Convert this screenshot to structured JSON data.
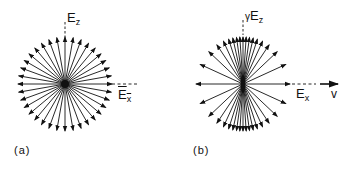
{
  "figure": {
    "panels": [
      {
        "id": "a",
        "caption": "(a)",
        "description": "Isotropic radial electric field of a charge at rest",
        "center": [
          65,
          84
        ],
        "radius": 47,
        "arrow_count": 36,
        "labels": {
          "vertical": {
            "main": "E",
            "sub": "z"
          },
          "horizontal": {
            "main": "E",
            "sub": "x"
          }
        }
      },
      {
        "id": "b",
        "caption": "(b)",
        "description": "Field lines of a moving charge compressed toward the transverse direction",
        "center": [
          243,
          84
        ],
        "radius": 48,
        "arrow_count": 36,
        "labels": {
          "vertical": {
            "prefix": "γ",
            "main": "E",
            "sub": "z"
          },
          "horizontal": {
            "main": "E",
            "sub": "x"
          },
          "velocity": "v"
        }
      }
    ],
    "colors": {
      "ink": "#111111",
      "background": "#ffffff"
    }
  }
}
